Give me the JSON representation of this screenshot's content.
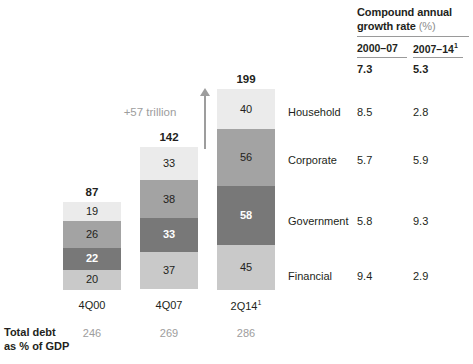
{
  "cagr": {
    "title_main": "Compound annual",
    "title_second": "growth rate",
    "title_unit": "(%)",
    "col1": "2000–07",
    "col2": "2007–14",
    "col2_sup": "1",
    "total1": "7.3",
    "total2": "5.3"
  },
  "categories": [
    {
      "name": "Household",
      "cagr1": "8.5",
      "cagr2": "2.8",
      "color": "#ebebeb"
    },
    {
      "name": "Corporate",
      "cagr1": "5.7",
      "cagr2": "5.9",
      "color": "#a3a3a3"
    },
    {
      "name": "Government",
      "cagr1": "5.8",
      "cagr2": "9.3",
      "color": "#787878"
    },
    {
      "name": "Financial",
      "cagr1": "9.4",
      "cagr2": "2.9",
      "color": "#c9c9c9"
    }
  ],
  "annotation": {
    "delta": "+57 trillion"
  },
  "footer": {
    "label_line1": "Total debt",
    "label_line2": "as % of GDP",
    "values": [
      "246",
      "269",
      "286"
    ]
  },
  "chart_data": {
    "type": "bar",
    "subtype": "stacked-column",
    "title": "",
    "xlabel": "",
    "ylabel": "",
    "categories": [
      "4Q00",
      "4Q07",
      "2Q14"
    ],
    "category_superscripts": [
      "",
      "",
      "1"
    ],
    "series": [
      {
        "name": "Household",
        "values": [
          19,
          33,
          40
        ],
        "color": "#ebebeb"
      },
      {
        "name": "Corporate",
        "values": [
          26,
          38,
          56
        ],
        "color": "#a3a3a3"
      },
      {
        "name": "Government",
        "values": [
          22,
          33,
          58
        ],
        "color": "#787878"
      },
      {
        "name": "Financial",
        "values": [
          20,
          37,
          45
        ],
        "color": "#c9c9c9"
      }
    ],
    "stack_order_top_to_bottom": [
      "Household",
      "Corporate",
      "Government",
      "Financial"
    ],
    "totals": [
      87,
      142,
      199
    ],
    "total_labels": [
      "87",
      "142",
      "199"
    ],
    "segment_labels": [
      [
        "19",
        "26",
        "22",
        "20"
      ],
      [
        "33",
        "38",
        "33",
        "37"
      ],
      [
        "40",
        "56",
        "58",
        "45"
      ]
    ],
    "ylim": [
      0,
      199
    ],
    "grid": false,
    "legend": "right-inline-category-labels",
    "annotations": [
      {
        "text": "+57 trillion",
        "type": "growth-arrow",
        "from": 142,
        "to": 199
      }
    ],
    "secondary_table": {
      "header": "Compound annual growth rate (%)",
      "columns": [
        "2000–07",
        "2007–14"
      ],
      "total_row": [
        "7.3",
        "5.3"
      ],
      "rows": [
        {
          "label": "Household",
          "values": [
            "8.5",
            "2.8"
          ]
        },
        {
          "label": "Corporate",
          "values": [
            "5.7",
            "5.9"
          ]
        },
        {
          "label": "Government",
          "values": [
            "5.8",
            "9.3"
          ]
        },
        {
          "label": "Financial",
          "values": [
            "9.4",
            "2.9"
          ]
        }
      ]
    },
    "footer_row": {
      "label": "Total debt as % of GDP",
      "values": [
        "246",
        "269",
        "286"
      ]
    }
  }
}
